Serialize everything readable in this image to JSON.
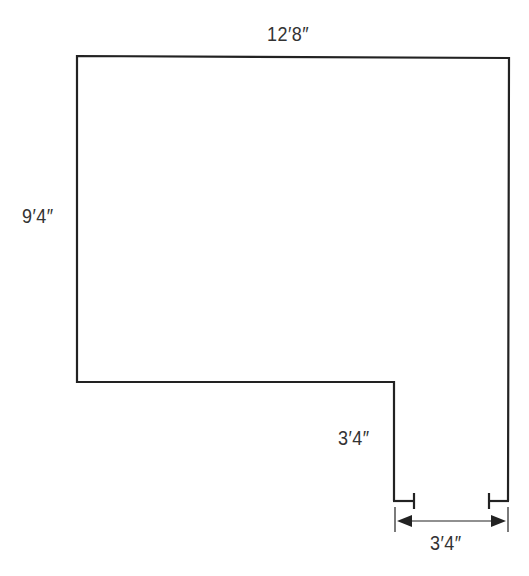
{
  "diagram": {
    "type": "floor-plan",
    "shape": "L-shaped room outline",
    "line_color": "#222222",
    "text_color": "#333333",
    "labels": {
      "top_width": "12′8″",
      "left_height": "9′4″",
      "notch_height": "3′4″",
      "opening_width": "3′4″"
    }
  }
}
